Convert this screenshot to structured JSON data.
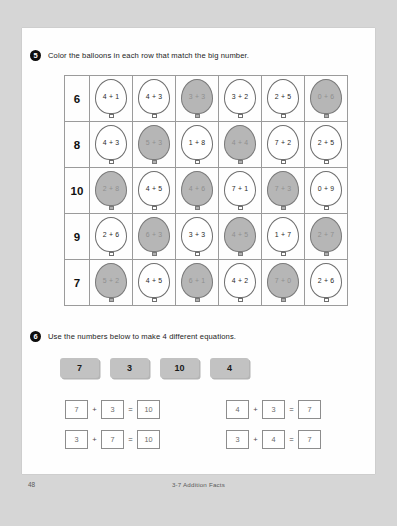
{
  "footer": {
    "page_number": "48",
    "lesson_title": "3-7 Addition Facts"
  },
  "exercise5": {
    "badge": "5",
    "instruction": "Color the balloons in each row that match the big number.",
    "rows": [
      {
        "target": "6",
        "balloons": [
          {
            "text": "4 + 1",
            "shaded": false
          },
          {
            "text": "4 + 3",
            "shaded": false
          },
          {
            "text": "3 + 3",
            "shaded": true
          },
          {
            "text": "3 + 2",
            "shaded": false
          },
          {
            "text": "2 + 5",
            "shaded": false
          },
          {
            "text": "0 + 6",
            "shaded": true
          }
        ]
      },
      {
        "target": "8",
        "balloons": [
          {
            "text": "4 + 3",
            "shaded": false
          },
          {
            "text": "5 + 3",
            "shaded": true
          },
          {
            "text": "1 + 8",
            "shaded": false
          },
          {
            "text": "4 + 4",
            "shaded": true
          },
          {
            "text": "7 + 2",
            "shaded": false
          },
          {
            "text": "2 + 5",
            "shaded": false
          }
        ]
      },
      {
        "target": "10",
        "balloons": [
          {
            "text": "2 + 8",
            "shaded": true
          },
          {
            "text": "4 + 5",
            "shaded": false
          },
          {
            "text": "4 + 6",
            "shaded": true
          },
          {
            "text": "7 + 1",
            "shaded": false
          },
          {
            "text": "7 + 3",
            "shaded": true
          },
          {
            "text": "0 + 9",
            "shaded": false
          }
        ]
      },
      {
        "target": "9",
        "balloons": [
          {
            "text": "2 + 6",
            "shaded": false
          },
          {
            "text": "6 + 3",
            "shaded": true
          },
          {
            "text": "3 + 3",
            "shaded": false
          },
          {
            "text": "4 + 5",
            "shaded": true
          },
          {
            "text": "1 + 7",
            "shaded": false
          },
          {
            "text": "2 + 7",
            "shaded": true
          }
        ]
      },
      {
        "target": "7",
        "balloons": [
          {
            "text": "5 + 2",
            "shaded": true
          },
          {
            "text": "4 + 5",
            "shaded": false
          },
          {
            "text": "6 + 1",
            "shaded": true
          },
          {
            "text": "4 + 2",
            "shaded": false
          },
          {
            "text": "7 + 0",
            "shaded": true
          },
          {
            "text": "2 + 6",
            "shaded": false
          }
        ]
      }
    ]
  },
  "exercise6": {
    "badge": "6",
    "instruction": "Use the numbers below to make 4 different equations.",
    "tiles": [
      "7",
      "3",
      "10",
      "4"
    ],
    "equations": [
      {
        "a": "7",
        "op": "+",
        "b": "3",
        "eq": "=",
        "result": "10"
      },
      {
        "a": "4",
        "op": "+",
        "b": "3",
        "eq": "=",
        "result": "7"
      },
      {
        "a": "3",
        "op": "+",
        "b": "7",
        "eq": "=",
        "result": "10"
      },
      {
        "a": "3",
        "op": "+",
        "b": "4",
        "eq": "=",
        "result": "7"
      }
    ]
  }
}
